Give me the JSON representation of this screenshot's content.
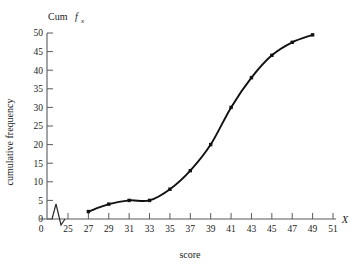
{
  "chart_data": {
    "type": "line",
    "title": "",
    "header_label": "Cum",
    "header_symbol": "f",
    "header_subscript": "x",
    "xlabel": "score",
    "ylabel": "cumulative frequency",
    "x_axis_symbol": "X",
    "x": [
      27,
      29,
      31,
      33,
      35,
      37,
      39,
      41,
      43,
      45,
      47,
      49
    ],
    "values": [
      2,
      4,
      5,
      5,
      8,
      13,
      20,
      30,
      38,
      44,
      47.5,
      49.5
    ],
    "xlim": [
      25,
      51
    ],
    "ylim": [
      0,
      50
    ],
    "xticks": [
      25,
      27,
      29,
      31,
      33,
      35,
      37,
      39,
      41,
      43,
      45,
      47,
      49,
      51
    ],
    "xtick_labels": [
      "25",
      "27",
      "29",
      "31",
      "33",
      "35",
      "37",
      "39",
      "41",
      "43",
      "45",
      "47",
      "49",
      "51"
    ],
    "yticks": [
      0,
      5,
      10,
      15,
      20,
      25,
      30,
      35,
      40,
      45,
      50
    ],
    "ytick_labels": [
      "0",
      "5",
      "10",
      "15",
      "20",
      "25",
      "30",
      "35",
      "40",
      "45",
      "50"
    ],
    "origin_label": "0",
    "axis_break": true,
    "grid": false,
    "legend": "none",
    "curve_color": "#111111",
    "axis_color": "#555b5e"
  }
}
